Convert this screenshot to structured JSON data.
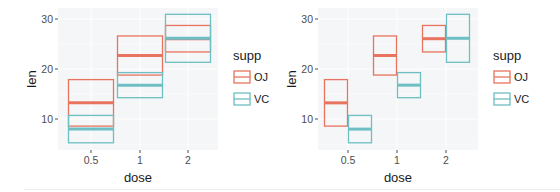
{
  "colors": {
    "OJ": "#E8735F",
    "VC": "#6DBFC3",
    "panel_bg": "#F5F6F7",
    "grid": "#FFFFFF",
    "text": "#4D4D4D",
    "title": "#1A1A1A"
  },
  "chart_data": [
    {
      "type": "crossbar",
      "position": "overlay",
      "title": "",
      "xlabel": "dose",
      "ylabel": "len",
      "categories": [
        "0.5",
        "1",
        "2"
      ],
      "yticks": [
        10,
        20,
        30
      ],
      "ylim": [
        4.0,
        32.4
      ],
      "grid": true,
      "legend": {
        "title": "supp",
        "entries": [
          "OJ",
          "VC"
        ],
        "position": "right"
      },
      "series": [
        {
          "name": "OJ",
          "mean": [
            13.23,
            22.7,
            26.06
          ],
          "ymin": [
            8.58,
            18.79,
            23.41
          ],
          "ymax": [
            17.88,
            26.61,
            28.71
          ]
        },
        {
          "name": "VC",
          "mean": [
            7.98,
            16.77,
            26.14
          ],
          "ymin": [
            5.24,
            14.26,
            21.34
          ],
          "ymax": [
            10.72,
            19.28,
            30.94
          ]
        }
      ]
    },
    {
      "type": "crossbar",
      "position": "dodge",
      "title": "",
      "xlabel": "dose",
      "ylabel": "len",
      "categories": [
        "0.5",
        "1",
        "2"
      ],
      "yticks": [
        10,
        20,
        30
      ],
      "ylim": [
        4.0,
        32.4
      ],
      "grid": true,
      "legend": {
        "title": "supp",
        "entries": [
          "OJ",
          "VC"
        ],
        "position": "right"
      },
      "series": [
        {
          "name": "OJ",
          "mean": [
            13.23,
            22.7,
            26.06
          ],
          "ymin": [
            8.58,
            18.79,
            23.41
          ],
          "ymax": [
            17.88,
            26.61,
            28.71
          ]
        },
        {
          "name": "VC",
          "mean": [
            7.98,
            16.77,
            26.14
          ],
          "ymin": [
            5.24,
            14.26,
            21.34
          ],
          "ymax": [
            10.72,
            19.28,
            30.94
          ]
        }
      ]
    }
  ]
}
